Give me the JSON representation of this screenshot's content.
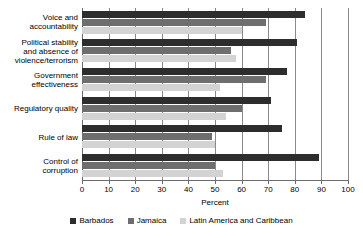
{
  "chart_data": {
    "type": "bar",
    "orientation": "horizontal",
    "title": "",
    "xlabel": "Percent",
    "ylabel": "",
    "xlim": [
      0,
      100
    ],
    "xticks": [
      0,
      10,
      20,
      30,
      40,
      50,
      60,
      70,
      80,
      90,
      100
    ],
    "grid": true,
    "legend_position": "bottom",
    "categories": [
      "Voice and accountability",
      "Political stability and absence of violence/terrorism",
      "Government effectiveness",
      "Regulatory quality",
      "Rule of law",
      "Control of corruption"
    ],
    "category_lines": [
      [
        "Voice and",
        "accountability"
      ],
      [
        "Political stability",
        "and absence of",
        "violence/terrorism"
      ],
      [
        "Government",
        "effectiveness"
      ],
      [
        "Regulatory quality"
      ],
      [
        "Rule of law"
      ],
      [
        "Control of",
        "corruption"
      ]
    ],
    "series": [
      {
        "name": "Barbados",
        "color": "#2d2d2d",
        "values": [
          84,
          81,
          77,
          71,
          75,
          89
        ]
      },
      {
        "name": "Jamaica",
        "color": "#6e6e6e",
        "values": [
          69,
          56,
          69,
          60,
          49,
          50
        ]
      },
      {
        "name": "Latin America and Caribbean",
        "color": "#d3d3d3",
        "values": [
          60,
          58,
          52,
          54,
          50,
          53
        ]
      }
    ]
  },
  "legend": {
    "items": [
      {
        "label": "Barbados"
      },
      {
        "label": "Jamaica"
      },
      {
        "label": "Latin America and Caribbean"
      }
    ]
  },
  "axis": {
    "x_title": "Percent",
    "tick_labels": [
      "0",
      "10",
      "20",
      "30",
      "40",
      "50",
      "60",
      "70",
      "80",
      "90",
      "100"
    ]
  }
}
